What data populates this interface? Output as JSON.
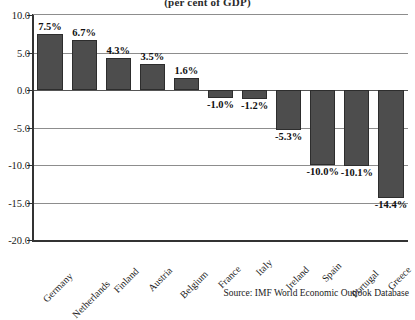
{
  "chart_data": {
    "type": "bar",
    "title": "(per cent of GDP)",
    "xlabel": "",
    "ylabel": "",
    "ylim": [
      -20.0,
      10.0
    ],
    "ytick_labels": [
      "10.0",
      "5.0",
      "0.0",
      "-5.0",
      "-10.0",
      "-15.0",
      "-20.0"
    ],
    "yticks": [
      10.0,
      5.0,
      0.0,
      -5.0,
      -10.0,
      -15.0,
      -20.0
    ],
    "grid": true,
    "legend": "none",
    "categories": [
      "Germany",
      "Netherlands",
      "Finland",
      "Austria",
      "Belgium",
      "France",
      "Italy",
      "Ireland",
      "Spain",
      "Portugal",
      "Greece"
    ],
    "values": [
      7.5,
      6.7,
      4.3,
      3.5,
      1.6,
      -1.0,
      -1.2,
      -5.3,
      -10.0,
      -10.1,
      -14.4
    ],
    "data_labels": [
      "7.5%",
      "6.7%",
      "4.3%",
      "3.5%",
      "1.6%",
      "-1.0%",
      "-1.2%",
      "-5.3%",
      "-10.0%",
      "-10.1%",
      "-14.4%"
    ],
    "bar_color": "#4d4d4d",
    "bar_edge_color": "#2d2d2d",
    "grid_color": "#8d8d8d"
  },
  "source": {
    "text": "Source: IMF World Economic Outlook Database"
  }
}
